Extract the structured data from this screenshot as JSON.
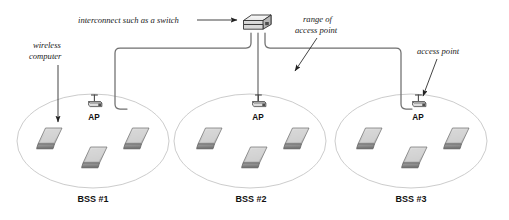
{
  "diagram": {
    "background": "#ffffff",
    "canvas": {
      "width": 509,
      "height": 220
    },
    "colors": {
      "cable": "#6b6b6b",
      "ellipse": "#c8c8c8",
      "laptop_top": "#c9c9c9",
      "laptop_base": "#8f8f8f",
      "outline": "#3a3a3a",
      "text": "#111111",
      "arrow": "#222222"
    }
  },
  "annotations": [
    {
      "id": "interconnect",
      "lines": [
        "interconnect such as a switch"
      ],
      "style": "italic-serif",
      "pointer": "horizontal-line-with-arrowhead",
      "points_to": "switch"
    },
    {
      "id": "wireless-computer",
      "lines": [
        "wireless",
        "computer"
      ],
      "style": "italic-serif",
      "pointer": "vertical-line-with-arrowhead",
      "points_to": "laptop-bss1-left"
    },
    {
      "id": "range-of-access-point",
      "lines": [
        "range of",
        "access point"
      ],
      "style": "italic-serif",
      "pointer": "diagonal-line-with-arrowhead",
      "points_to": "bss2-ellipse"
    },
    {
      "id": "access-point",
      "lines": [
        "access point"
      ],
      "style": "italic-serif",
      "pointer": "diagonal-line-with-arrowhead",
      "points_to": "ap-bss3"
    }
  ],
  "switch": {
    "label": "switch",
    "ports": 3,
    "shape": "3d-box"
  },
  "cells": [
    {
      "id": "bss1",
      "label": "BSS #1",
      "ap_label": "AP",
      "laptops": [
        "laptop-left",
        "laptop-center",
        "laptop-right"
      ]
    },
    {
      "id": "bss2",
      "label": "BSS #2",
      "ap_label": "AP",
      "laptops": [
        "laptop-left",
        "laptop-center",
        "laptop-right"
      ]
    },
    {
      "id": "bss3",
      "label": "BSS #3",
      "ap_label": "AP",
      "laptops": [
        "laptop-left",
        "laptop-center",
        "laptop-right"
      ]
    }
  ]
}
